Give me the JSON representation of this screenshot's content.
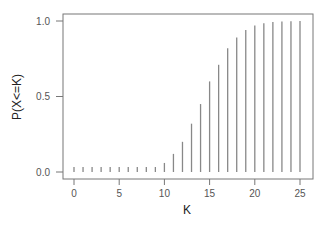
{
  "chart_data": {
    "type": "bar",
    "title": "",
    "xlabel": "K",
    "ylabel": "P(X<=K)",
    "x": [
      0,
      1,
      2,
      3,
      4,
      5,
      6,
      7,
      8,
      9,
      10,
      11,
      12,
      13,
      14,
      15,
      16,
      17,
      18,
      19,
      20,
      21,
      22,
      23,
      24,
      25
    ],
    "values": [
      0.0,
      0.0,
      0.0,
      0.0,
      0.0,
      0.0,
      0.0,
      0.003,
      0.01,
      0.03,
      0.06,
      0.12,
      0.2,
      0.32,
      0.45,
      0.6,
      0.71,
      0.82,
      0.89,
      0.94,
      0.97,
      0.985,
      0.993,
      0.997,
      0.999,
      1.0
    ],
    "xlim": [
      -1.2,
      26.2
    ],
    "ylim": [
      -0.05,
      1.05
    ],
    "xticks": [
      0,
      5,
      10,
      15,
      20,
      25
    ],
    "yticks": [
      0.0,
      0.5,
      1.0
    ],
    "ytick_labels": [
      "0.0",
      "0.5",
      "1.0"
    ],
    "grid": false,
    "bar_color": "#888888"
  }
}
